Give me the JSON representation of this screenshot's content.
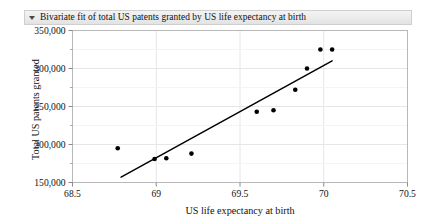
{
  "panel": {
    "title": "Bivariate fit of total US patents granted by US life expectancy at birth",
    "disclosure_icon": "triangle-down-icon"
  },
  "chart_data": {
    "type": "scatter",
    "title": "Bivariate fit of total US patents granted by US life expectancy at birth",
    "xlabel": "US life expectancy at birth",
    "ylabel": "Total US patents granted",
    "xlim": [
      68.5,
      70.5
    ],
    "ylim": [
      150000,
      350000
    ],
    "grid": true,
    "legend": null,
    "xticks": [
      68.5,
      69,
      69.5,
      70,
      70.5
    ],
    "xtick_labels": [
      "68.5",
      "69",
      "69.5",
      "70",
      "70.5"
    ],
    "yticks": [
      150000,
      200000,
      250000,
      300000,
      350000
    ],
    "ytick_labels": [
      "150,000",
      "200,000",
      "250,000",
      "300,000",
      "350,000"
    ],
    "y_minor_ticks": [
      175000,
      225000,
      275000,
      325000
    ],
    "series": [
      {
        "name": "observations",
        "type": "scatter",
        "marker": "filled-circle",
        "color": "#000000",
        "points": [
          {
            "x": 68.77,
            "y": 195000
          },
          {
            "x": 68.99,
            "y": 181000
          },
          {
            "x": 69.06,
            "y": 182000
          },
          {
            "x": 69.21,
            "y": 188000
          },
          {
            "x": 69.6,
            "y": 243000
          },
          {
            "x": 69.7,
            "y": 245000
          },
          {
            "x": 69.83,
            "y": 272000
          },
          {
            "x": 69.9,
            "y": 300000
          },
          {
            "x": 69.98,
            "y": 325000
          },
          {
            "x": 70.05,
            "y": 325000
          }
        ]
      },
      {
        "name": "linear-fit-line",
        "type": "line",
        "color": "#000000",
        "points": [
          {
            "x": 68.79,
            "y": 157000
          },
          {
            "x": 70.05,
            "y": 310000
          }
        ]
      }
    ]
  }
}
